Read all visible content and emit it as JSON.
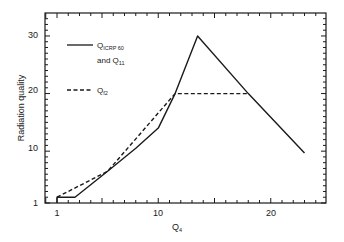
{
  "chart_data": {
    "type": "line",
    "title": "",
    "xlabel": "Q4",
    "ylabel": "Radiation quality",
    "xlim": [
      0,
      24.5
    ],
    "ylim": [
      1,
      33
    ],
    "x_ticks": [
      1,
      10,
      20
    ],
    "y_ticks": [
      1,
      10,
      20,
      30
    ],
    "grid": false,
    "legend_position": "upper left",
    "series": [
      {
        "name": "Q_ICRP 60 and Q_11",
        "style": "solid",
        "points": [
          [
            1,
            1
          ],
          [
            1,
            2
          ],
          [
            2.6,
            2
          ],
          [
            5.5,
            6.5
          ],
          [
            8,
            10.5
          ],
          [
            10,
            14
          ],
          [
            11.5,
            20
          ],
          [
            13.5,
            30
          ],
          [
            18,
            20
          ],
          [
            23,
            9.7
          ]
        ]
      },
      {
        "name": "Q_f2",
        "style": "dashed",
        "points": [
          [
            1,
            2
          ],
          [
            5.5,
            6.5
          ],
          [
            11.5,
            20
          ],
          [
            18,
            20
          ]
        ]
      }
    ]
  },
  "axes": {
    "xlabel_main": "Q",
    "xlabel_sub": "4",
    "ylabel": "Radiation quality",
    "x_tick_labels": [
      "1",
      "10",
      "20"
    ],
    "y_tick_labels": [
      "1",
      "10",
      "20",
      "30"
    ]
  },
  "legend": {
    "solid_main": "Q",
    "solid_sub": "ICRP 60",
    "solid_line2_main": "and Q",
    "solid_line2_sub": "11",
    "dashed_main": "Q",
    "dashed_sub": "f2"
  }
}
